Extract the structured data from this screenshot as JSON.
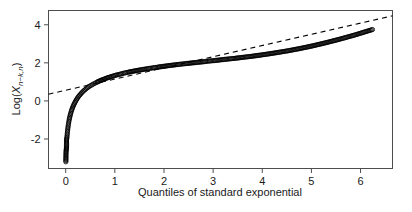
{
  "chart_data": {
    "type": "scatter",
    "title": "",
    "subtitle": "",
    "xlabel": "Quantiles of standard exponential",
    "ylabel_plain": "Log(X_{n-k,n})",
    "ylabel_parts": {
      "prefix": "Log(",
      "variable": "X",
      "subscript": "n−k,n",
      "suffix": ")"
    },
    "xlim": [
      -0.35,
      6.65
    ],
    "ylim": [
      -3.55,
      4.75
    ],
    "xticks": [
      0,
      1,
      2,
      3,
      4,
      5,
      6
    ],
    "xtick_labels": [
      "0",
      "1",
      "2",
      "3",
      "4",
      "5",
      "6"
    ],
    "yticks": [
      -2,
      0,
      2,
      4
    ],
    "ytick_labels": [
      "-2",
      "0",
      "2",
      "4"
    ],
    "grid": false,
    "legend": "none",
    "marker": "open-circle",
    "marker_color": "#000000",
    "marker_size": 2.1,
    "line_color": "#000000",
    "line_style": "dashed",
    "annotations": [],
    "reference_line": {
      "name": "fitted exponential QQ reference line",
      "style": "dashed",
      "intercept": 0.56,
      "slope": 0.588,
      "x_start": -0.35,
      "x_end": 6.65,
      "y_start": 0.354,
      "y_end": 4.47
    },
    "series": [
      {
        "name": "log order statistics",
        "points": [
          [
            0.003,
            -3.2
          ],
          [
            0.006,
            -2.78
          ],
          [
            0.008,
            -2.66
          ],
          [
            0.01,
            -2.6
          ],
          [
            0.012,
            -2.55
          ],
          [
            0.014,
            -2.5
          ],
          [
            0.016,
            -2.46
          ],
          [
            0.018,
            -2.05
          ],
          [
            0.02,
            -2.0
          ],
          [
            0.023,
            -1.95
          ],
          [
            0.026,
            -1.88
          ],
          [
            0.029,
            -1.8
          ],
          [
            0.032,
            -1.72
          ],
          [
            0.035,
            -1.64
          ],
          [
            0.038,
            -1.56
          ],
          [
            0.042,
            -1.48
          ],
          [
            0.046,
            -1.4
          ],
          [
            0.05,
            -1.32
          ],
          [
            0.055,
            -1.24
          ],
          [
            0.06,
            -1.16
          ],
          [
            0.065,
            -1.08
          ],
          [
            0.07,
            -1.0
          ],
          [
            0.076,
            -0.93
          ],
          [
            0.082,
            -0.86
          ],
          [
            0.088,
            -0.79
          ],
          [
            0.095,
            -0.72
          ],
          [
            0.102,
            -0.65
          ],
          [
            0.11,
            -0.58
          ],
          [
            0.118,
            -0.51
          ],
          [
            0.126,
            -0.45
          ],
          [
            0.135,
            -0.38
          ],
          [
            0.145,
            -0.32
          ],
          [
            0.155,
            -0.26
          ],
          [
            0.165,
            -0.2
          ],
          [
            0.176,
            -0.14
          ],
          [
            0.188,
            -0.08
          ],
          [
            0.2,
            -0.02
          ],
          [
            0.213,
            0.04
          ],
          [
            0.226,
            0.1
          ],
          [
            0.24,
            0.15
          ],
          [
            0.255,
            0.21
          ],
          [
            0.27,
            0.26
          ],
          [
            0.286,
            0.31
          ],
          [
            0.303,
            0.36
          ],
          [
            0.32,
            0.41
          ],
          [
            0.338,
            0.46
          ],
          [
            0.357,
            0.51
          ],
          [
            0.377,
            0.56
          ],
          [
            0.398,
            0.6
          ],
          [
            0.42,
            0.65
          ],
          [
            0.443,
            0.69
          ],
          [
            0.467,
            0.74
          ],
          [
            0.492,
            0.78
          ],
          [
            0.518,
            0.82
          ],
          [
            0.545,
            0.86
          ],
          [
            0.573,
            0.9
          ],
          [
            0.602,
            0.94
          ],
          [
            0.633,
            0.98
          ],
          [
            0.665,
            1.02
          ],
          [
            0.698,
            1.06
          ],
          [
            0.733,
            1.1
          ],
          [
            0.769,
            1.13
          ],
          [
            0.806,
            1.17
          ],
          [
            0.845,
            1.21
          ],
          [
            0.886,
            1.24
          ],
          [
            0.928,
            1.28
          ],
          [
            0.972,
            1.31
          ],
          [
            1.018,
            1.35
          ],
          [
            1.065,
            1.38
          ],
          [
            1.115,
            1.41
          ],
          [
            1.166,
            1.45
          ],
          [
            1.22,
            1.48
          ],
          [
            1.275,
            1.51
          ],
          [
            1.333,
            1.54
          ],
          [
            1.393,
            1.57
          ],
          [
            1.456,
            1.6
          ],
          [
            1.521,
            1.63
          ],
          [
            1.589,
            1.66
          ],
          [
            1.659,
            1.69
          ],
          [
            1.733,
            1.72
          ],
          [
            1.809,
            1.75
          ],
          [
            1.889,
            1.78
          ],
          [
            1.972,
            1.81
          ],
          [
            2.058,
            1.84
          ],
          [
            2.148,
            1.87
          ],
          [
            2.242,
            1.9
          ],
          [
            2.34,
            1.93
          ],
          [
            2.442,
            1.96
          ],
          [
            2.549,
            1.99
          ],
          [
            2.66,
            2.02
          ],
          [
            2.777,
            2.05
          ],
          [
            2.899,
            2.09
          ],
          [
            3.027,
            2.12
          ],
          [
            3.161,
            2.16
          ],
          [
            3.302,
            2.2
          ],
          [
            3.45,
            2.24
          ],
          [
            3.606,
            2.29
          ],
          [
            3.771,
            2.34
          ],
          [
            3.945,
            2.4
          ],
          [
            4.13,
            2.47
          ],
          [
            4.327,
            2.55
          ],
          [
            4.537,
            2.64
          ],
          [
            4.762,
            2.75
          ],
          [
            5.004,
            2.88
          ],
          [
            5.268,
            3.04
          ],
          [
            5.557,
            3.23
          ],
          [
            5.879,
            3.46
          ],
          [
            6.243,
            3.75
          ]
        ]
      }
    ]
  },
  "axes": {
    "x_axis_name": "x-axis",
    "y_axis_name": "y-axis"
  }
}
